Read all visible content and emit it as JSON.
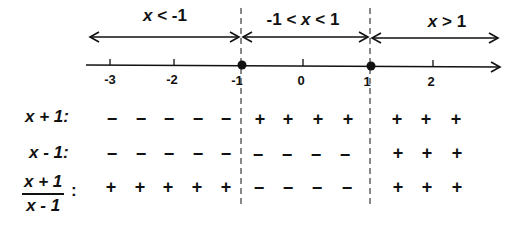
{
  "intervals": [
    {
      "label": "x < -1",
      "parts": [
        "x",
        " < -1"
      ],
      "center_x": 165
    },
    {
      "label": "-1 < x < 1",
      "parts": [
        "-1 < ",
        "x",
        " < 1"
      ],
      "center_x": 303
    },
    {
      "label": "x > 1",
      "parts": [
        "x",
        " > 1"
      ],
      "center_x": 447
    }
  ],
  "number_line": {
    "ticks": [
      {
        "value": "-3",
        "x": 110
      },
      {
        "value": "-2",
        "x": 174
      },
      {
        "value": "-1",
        "x": 241
      },
      {
        "value": "0",
        "x": 303
      },
      {
        "value": "1",
        "x": 370
      },
      {
        "value": "2",
        "x": 433
      }
    ],
    "critical_points": [
      "-1",
      "1"
    ]
  },
  "rows": [
    {
      "label": "x + 1:",
      "signs": {
        "left": [
          "−",
          "−",
          "−",
          "−",
          "−"
        ],
        "middle": [
          "+",
          "+",
          "+",
          "+"
        ],
        "right": [
          "+",
          "+",
          "+"
        ]
      }
    },
    {
      "label": "x - 1:",
      "signs": {
        "left": [
          "−",
          "−",
          "−",
          "−",
          "−"
        ],
        "middle": [
          "−",
          "−",
          "−",
          "−"
        ],
        "right": [
          "+",
          "+",
          "+"
        ]
      }
    },
    {
      "label_num": "x + 1",
      "label_den": "x - 1",
      "label_colon": ":",
      "signs": {
        "left": [
          "+",
          "+",
          "+",
          "+",
          "+"
        ],
        "middle": [
          "−",
          "−",
          "−",
          "−"
        ],
        "right": [
          "+",
          "+",
          "+"
        ]
      }
    }
  ],
  "colors": {
    "ink": "#111111",
    "background": "#ffffff"
  }
}
